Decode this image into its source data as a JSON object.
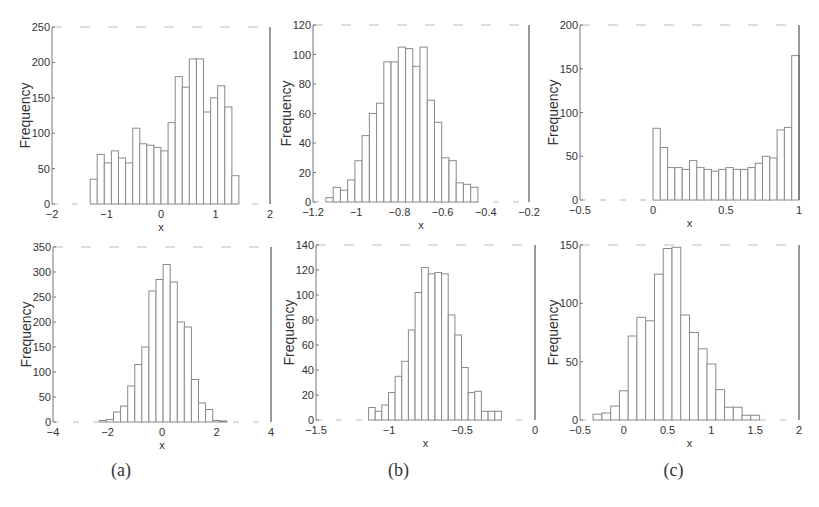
{
  "figure": {
    "captions": [
      "(a)",
      "(b)",
      "(c)"
    ]
  },
  "chart_data": [
    {
      "id": "a-top",
      "type": "bar",
      "subtype": "histogram",
      "title": "",
      "xlabel": "x",
      "ylabel": "Frequency",
      "xlim": [
        -2,
        2
      ],
      "ylim": [
        0,
        250
      ],
      "xticks": [
        "-2",
        "-1",
        "0",
        "1",
        "2"
      ],
      "yticks": [
        "0",
        "50",
        "100",
        "150",
        "200",
        "250"
      ],
      "bin_start": -1.3,
      "bin_width": 0.13,
      "values": [
        35,
        70,
        58,
        75,
        65,
        58,
        107,
        85,
        83,
        80,
        75,
        115,
        180,
        165,
        205,
        205,
        130,
        150,
        167,
        137,
        40
      ]
    },
    {
      "id": "b-top",
      "type": "bar",
      "subtype": "histogram",
      "title": "",
      "xlabel": "x",
      "ylabel": "Frequency",
      "xlim": [
        -1.2,
        -0.2
      ],
      "ylim": [
        0,
        120
      ],
      "xticks": [
        "-1.2",
        "-1",
        "-0.8",
        "-0.6",
        "-0.4",
        "-0.2"
      ],
      "yticks": [
        "0",
        "20",
        "40",
        "60",
        "80",
        "100",
        "120"
      ],
      "bin_start": -1.14,
      "bin_width": 0.0335,
      "values": [
        3,
        10,
        8,
        15,
        28,
        45,
        60,
        67,
        95,
        95,
        105,
        104,
        92,
        105,
        69,
        54,
        30,
        28,
        13,
        12,
        10
      ]
    },
    {
      "id": "c-top",
      "type": "bar",
      "subtype": "histogram",
      "title": "",
      "xlabel": "x",
      "ylabel": "Frequency",
      "xlim": [
        -0.5,
        1
      ],
      "ylim": [
        0,
        200
      ],
      "xticks": [
        "-0.5",
        "0",
        "0.5",
        "1"
      ],
      "yticks": [
        "0",
        "50",
        "100",
        "150",
        "200"
      ],
      "bin_start": 0,
      "bin_width": 0.05,
      "values": [
        82,
        60,
        37,
        37,
        35,
        45,
        37,
        35,
        33,
        35,
        37,
        35,
        35,
        37,
        42,
        50,
        48,
        80,
        83,
        165
      ]
    },
    {
      "id": "a-bottom",
      "type": "bar",
      "subtype": "histogram",
      "title": "",
      "xlabel": "x",
      "ylabel": "Frequency",
      "xlim": [
        -4,
        4
      ],
      "ylim": [
        0,
        350
      ],
      "xticks": [
        "-4",
        "-2",
        "0",
        "2",
        "4"
      ],
      "yticks": [
        "0",
        "50",
        "100",
        "150",
        "200",
        "250",
        "300",
        "350"
      ],
      "bin_start": -2.3,
      "bin_width": 0.26,
      "values": [
        3,
        5,
        20,
        32,
        72,
        115,
        150,
        262,
        285,
        315,
        280,
        200,
        190,
        85,
        38,
        25,
        3,
        2
      ]
    },
    {
      "id": "b-bottom",
      "type": "bar",
      "subtype": "histogram",
      "title": "",
      "xlabel": "x",
      "ylabel": "Frequency",
      "xlim": [
        -1.5,
        0
      ],
      "ylim": [
        0,
        140
      ],
      "xticks": [
        "-1.5",
        "-1",
        "-0.5",
        "0"
      ],
      "yticks": [
        "0",
        "20",
        "40",
        "60",
        "80",
        "100",
        "120",
        "140"
      ],
      "bin_start": -1.14,
      "bin_width": 0.0455,
      "values": [
        10,
        7,
        12,
        22,
        35,
        47,
        72,
        102,
        122,
        117,
        118,
        117,
        84,
        68,
        42,
        22,
        23,
        7,
        7,
        7
      ]
    },
    {
      "id": "c-bottom",
      "type": "bar",
      "subtype": "histogram",
      "title": "",
      "xlabel": "x",
      "ylabel": "Frequency",
      "xlim": [
        -0.5,
        2
      ],
      "ylim": [
        0,
        150
      ],
      "xticks": [
        "-0.5",
        "0",
        "0.5",
        "1",
        "1.5",
        "2"
      ],
      "yticks": [
        "0",
        "50",
        "100",
        "150"
      ],
      "bin_start": -0.35,
      "bin_width": 0.1,
      "values": [
        5,
        6,
        12,
        25,
        72,
        88,
        85,
        125,
        147,
        148,
        90,
        75,
        61,
        48,
        26,
        11,
        11,
        4,
        4
      ]
    }
  ]
}
